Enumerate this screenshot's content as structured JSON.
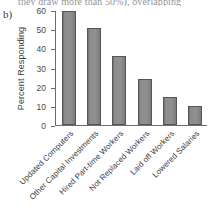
{
  "figure": {
    "panel_letter": "b)",
    "cut_off_line": "they draw more than 50%), overlapping"
  },
  "chart_data": {
    "type": "bar",
    "title": "",
    "xlabel": "",
    "ylabel": "Percent Responding",
    "categories": [
      "Updated Computers",
      "Other Capital Investments",
      "Hired Part-time Workers",
      "Not Replaced Workers",
      "Laid off Workers",
      "Lowered Salaries"
    ],
    "values": [
      60,
      51,
      36.5,
      24,
      15,
      10
    ],
    "ylim": [
      0,
      60
    ],
    "yticks": [
      0,
      10,
      20,
      30,
      40,
      50,
      60
    ],
    "ytick_labels": [
      "0",
      "10",
      "20",
      "30",
      "40",
      "50",
      "60"
    ],
    "grid": false,
    "legend": "none",
    "bar_color": "#8d8d8d",
    "bar_edge_color": "#555555",
    "axis_color": "#6d6d6d"
  }
}
